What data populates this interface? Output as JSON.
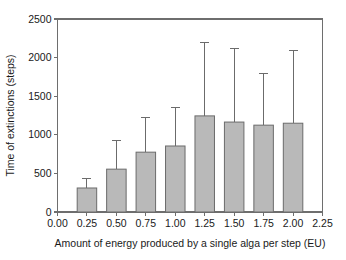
{
  "chart_data": {
    "type": "bar",
    "title": "",
    "xlabel": "Amount of energy produced by a single alga per step (EU)",
    "ylabel": "Time of extinctions (steps)",
    "categories": [
      "0.25",
      "0.50",
      "0.75",
      "1.00",
      "1.25",
      "1.50",
      "1.75",
      "2.00"
    ],
    "x": [
      0.25,
      0.5,
      0.75,
      1.0,
      1.25,
      1.5,
      1.75,
      2.0
    ],
    "values": [
      311,
      555,
      775,
      855,
      1245,
      1165,
      1125,
      1150
    ],
    "error_upper": [
      440,
      920,
      1220,
      1360,
      2195,
      2120,
      1790,
      2090
    ],
    "series": [
      {
        "name": "Time of extinctions",
        "values": [
          311,
          555,
          775,
          855,
          1245,
          1165,
          1125,
          1150
        ]
      }
    ],
    "xlim": [
      0.0,
      2.25
    ],
    "ylim": [
      0,
      2500
    ],
    "xticks": [
      0.0,
      0.25,
      0.5,
      0.75,
      1.0,
      1.25,
      1.5,
      1.75,
      2.0,
      2.25
    ],
    "xticklabels": [
      "0.00",
      "0.25",
      "0.50",
      "0.75",
      "1.00",
      "1.25",
      "1.50",
      "1.75",
      "2.00",
      "2.25"
    ],
    "yticks": [
      0,
      500,
      1000,
      1500,
      2000,
      2500
    ],
    "yticklabels": [
      "0",
      "500",
      "1000",
      "1500",
      "2000",
      "2500"
    ],
    "grid": false,
    "legend": false,
    "legend_position": "none",
    "bar_fill_color": "#b9b9b9",
    "bar_edge_color": "#6b6b6b",
    "error_bar_color": "#6b6b6b",
    "background_color": "#ffffff",
    "error_bar_direction": "upper-only"
  }
}
